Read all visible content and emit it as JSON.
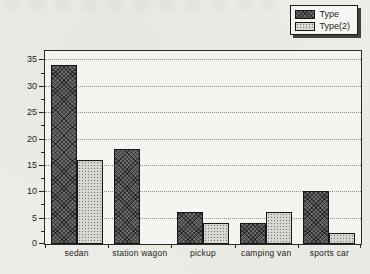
{
  "chart_data": {
    "type": "bar",
    "title": "",
    "categories": [
      "sedan",
      "station wagon",
      "pickup",
      "camping van",
      "sports car"
    ],
    "series": [
      {
        "name": "Type",
        "pattern": "crosshatch",
        "color": "#6b6b69",
        "values": [
          34,
          18,
          6,
          4,
          10
        ]
      },
      {
        "name": "Type(2)",
        "pattern": "dots",
        "color": "#d8d6d0",
        "values": [
          16,
          0,
          4,
          6,
          2
        ]
      }
    ],
    "xlabel": "",
    "ylabel": "Frequency",
    "ylim": [
      0,
      35
    ],
    "yticks": [
      0,
      5,
      10,
      15,
      20,
      25,
      30,
      35
    ],
    "minor_tick_step": 2.5,
    "grid": "dotted-horizontal",
    "gridline_color": "#8f8d86",
    "legend_position": "top-right",
    "frame_color": "#2b2b28",
    "plot_background": "#f5f4f0",
    "page_background": "#edece7"
  }
}
